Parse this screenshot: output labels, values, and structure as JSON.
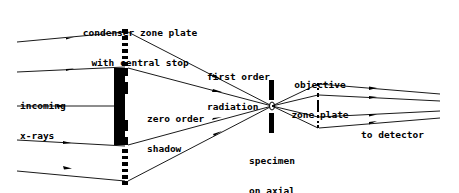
{
  "diagram": {
    "type": "x-ray microscope optical path",
    "labels": {
      "condenser": [
        "condenser zone plate",
        "with central stop"
      ],
      "incoming": [
        "incoming",
        "x-rays"
      ],
      "zero_order": [
        "zero order",
        "shadow"
      ],
      "first_order": [
        "first order",
        "radiation"
      ],
      "specimen": [
        "specimen",
        "on axial",
        "aperture"
      ],
      "objective": [
        "objective",
        "zone plate"
      ],
      "detector": "to detector"
    },
    "colors": {
      "line": "#000000",
      "background": "#ffffff"
    }
  }
}
